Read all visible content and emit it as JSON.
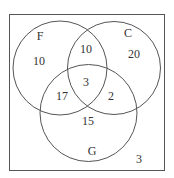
{
  "diagram": {
    "type": "venn",
    "sets": [
      {
        "label": "F",
        "only": "10"
      },
      {
        "label": "C",
        "only": "20"
      },
      {
        "label": "G",
        "only": "15"
      }
    ],
    "regions": {
      "F_only": "10",
      "C_only": "20",
      "G_only": "15",
      "F_and_C_only": "10",
      "F_and_G_only": "17",
      "C_and_G_only": "2",
      "F_and_C_and_G": "3",
      "outside": "3"
    },
    "colors": {
      "stroke": "#555555",
      "text": "#333333",
      "background": "#ffffff"
    }
  }
}
